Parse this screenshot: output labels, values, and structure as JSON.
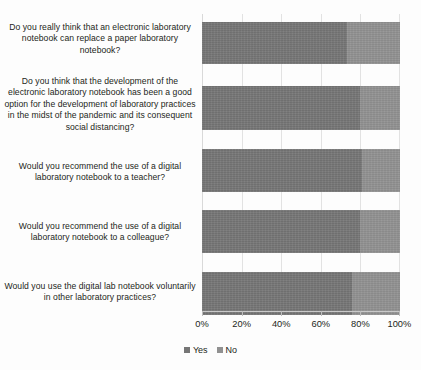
{
  "chart_data": {
    "type": "bar",
    "orientation": "horizontal",
    "stacked": true,
    "stack_mode": "100%",
    "title": "",
    "xlabel": "",
    "ylabel": "",
    "xlim": [
      0,
      100
    ],
    "grid": true,
    "legend_position": "bottom-center",
    "tick_labels": [
      "0%",
      "20%",
      "40%",
      "60%",
      "80%",
      "100%"
    ],
    "tick_values": [
      0,
      20,
      40,
      60,
      80,
      100
    ],
    "categories": [
      "Do you really think that an electronic laboratory notebook can replace a paper laboratory notebook?",
      "Do you think that the development of the electronic laboratory notebook has been a good option for the development of laboratory practices in the midst of the pandemic and its consequent social distancing?",
      "Would you recommend the use of a digital laboratory notebook to a teacher?",
      "Would you recommend the use of a digital laboratory notebook to a colleague?",
      "Would you use the digital lab notebook voluntarily in other laboratory practices?"
    ],
    "series": [
      {
        "name": "Yes",
        "color": "#767676",
        "values": [
          73,
          80,
          81,
          80,
          76
        ]
      },
      {
        "name": "No",
        "color": "#919191",
        "values": [
          27,
          20,
          19,
          20,
          24
        ]
      }
    ]
  },
  "legend": {
    "items": [
      {
        "label": "Yes"
      },
      {
        "label": "No"
      }
    ]
  }
}
